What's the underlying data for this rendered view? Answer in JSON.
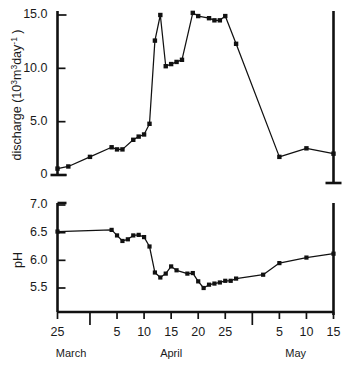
{
  "figure": {
    "background": "#ffffff",
    "ink_color": "#111111"
  },
  "chart_data": [
    {
      "id": "discharge-panel",
      "type": "line",
      "title": "",
      "xlabel": "",
      "ylabel": "discharge (10³m³day⁻¹)",
      "ylabel_parts": {
        "prefix": "discharge (10",
        "sup1": "3",
        "mid": "m",
        "sup2": "3",
        "unit": "day",
        "sup3": "-1",
        "suffix": " )"
      },
      "ylim": [
        0,
        15.5
      ],
      "yticks": [
        0,
        5.0,
        10.0,
        15.0
      ],
      "ytick_labels": [
        "0",
        "5.0",
        "10.0",
        "15.0"
      ],
      "xlim_day": [
        0,
        51
      ],
      "grid": false,
      "legend": "none",
      "series": [
        {
          "name": "discharge",
          "marker": "square",
          "x_day": [
            0,
            2,
            6,
            10,
            11,
            12,
            14,
            15,
            16,
            17,
            18,
            19,
            20,
            21,
            22,
            23,
            25,
            26,
            28,
            29,
            30,
            31,
            33,
            41,
            46,
            51
          ],
          "x_label": [
            "Mar 25",
            "Mar 27",
            "Mar 31",
            "Apr 4",
            "Apr 5",
            "Apr 6",
            "Apr 8",
            "Apr 9",
            "Apr 10",
            "Apr 11",
            "Apr 12",
            "Apr 13",
            "Apr 14",
            "Apr 15",
            "Apr 16",
            "Apr 17",
            "Apr 19",
            "Apr 20",
            "Apr 22",
            "Apr 23",
            "Apr 24",
            "Apr 25",
            "Apr 27",
            "May 5",
            "May 10",
            "May 15"
          ],
          "y": [
            0.6,
            0.8,
            1.7,
            2.6,
            2.4,
            2.4,
            3.3,
            3.6,
            3.8,
            4.8,
            12.6,
            15.0,
            10.2,
            10.4,
            10.6,
            10.8,
            15.2,
            14.9,
            14.7,
            14.5,
            14.5,
            14.9,
            12.3,
            1.7,
            2.5,
            2.0
          ]
        }
      ]
    },
    {
      "id": "ph-panel",
      "type": "line",
      "title": "",
      "xlabel": "",
      "ylabel": "pH",
      "ylim": [
        5.2,
        7.05
      ],
      "yticks": [
        5.5,
        6.0,
        6.5,
        7.0
      ],
      "ytick_labels": [
        "5.5",
        "6.0",
        "6.5",
        "7.0"
      ],
      "xlim_day": [
        0,
        51
      ],
      "grid": false,
      "legend": "none",
      "series": [
        {
          "name": "pH",
          "marker": "square",
          "x_day": [
            0,
            10,
            11,
            12,
            13,
            14,
            15,
            16,
            17,
            18,
            19,
            20,
            21,
            22,
            24,
            25,
            26,
            27,
            28,
            29,
            30,
            31,
            32,
            33,
            38,
            41,
            46,
            51
          ],
          "x_label": [
            "Mar 25",
            "Apr 4",
            "Apr 5",
            "Apr 6",
            "Apr 7",
            "Apr 8",
            "Apr 9",
            "Apr 10",
            "Apr 11",
            "Apr 12",
            "Apr 13",
            "Apr 14",
            "Apr 15",
            "Apr 16",
            "Apr 18",
            "Apr 19",
            "Apr 20",
            "Apr 21",
            "Apr 22",
            "Apr 23",
            "Apr 24",
            "Apr 25",
            "Apr 26",
            "Apr 27",
            "May 2",
            "May 5",
            "May 10",
            "May 15"
          ],
          "y": [
            6.52,
            6.55,
            6.45,
            6.35,
            6.38,
            6.45,
            6.46,
            6.42,
            6.25,
            5.78,
            5.69,
            5.76,
            5.89,
            5.82,
            5.76,
            5.77,
            5.62,
            5.5,
            5.56,
            5.58,
            5.6,
            5.63,
            5.63,
            5.67,
            5.74,
            5.95,
            6.05,
            6.12
          ]
        }
      ]
    }
  ],
  "xaxis": {
    "ticks": [
      {
        "day": 0,
        "label": "25",
        "long": false
      },
      {
        "day": 6,
        "label": "",
        "long": true
      },
      {
        "day": 11,
        "label": "5",
        "long": false
      },
      {
        "day": 16,
        "label": "10",
        "long": false
      },
      {
        "day": 21,
        "label": "15",
        "long": false
      },
      {
        "day": 26,
        "label": "20",
        "long": false
      },
      {
        "day": 31,
        "label": "25",
        "long": false
      },
      {
        "day": 36,
        "label": "",
        "long": true
      },
      {
        "day": 41,
        "label": "5",
        "long": false
      },
      {
        "day": 46,
        "label": "10",
        "long": false
      },
      {
        "day": 51,
        "label": "15",
        "long": false
      }
    ],
    "months": [
      {
        "label": "March",
        "day": 2.5
      },
      {
        "label": "April",
        "day": 21
      },
      {
        "label": "May",
        "day": 44
      }
    ]
  }
}
